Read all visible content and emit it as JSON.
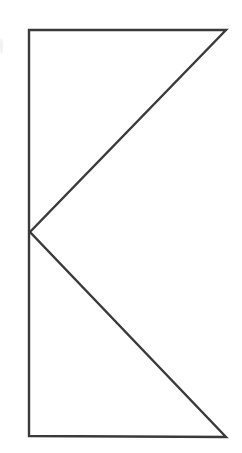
{
  "figure": {
    "title": "K-shaped geometric line figure",
    "canvas": {
      "width": 242,
      "height": 453,
      "background_color": "#ffffff"
    },
    "style": {
      "stroke_color": "#3a3a3a",
      "stroke_width": 2.4,
      "fill": "none"
    },
    "vertices": {
      "top_left": {
        "label": "top-left corner",
        "x": 29,
        "y": 30
      },
      "top_right": {
        "label": "top-right corner",
        "x": 226,
        "y": 30
      },
      "mid_left": {
        "label": "mid-left vertex",
        "x": 30,
        "y": 232
      },
      "bottom_right": {
        "label": "bottom-right corner",
        "x": 226,
        "y": 437
      },
      "bottom_left": {
        "label": "bottom-left corner",
        "x": 29,
        "y": 436
      }
    },
    "segments": [
      {
        "name": "top-horizontal-edge",
        "from": "top_left",
        "to": "top_right",
        "orientation": "horizontal"
      },
      {
        "name": "upper-diagonal-edge",
        "from": "top_right",
        "to": "mid_left",
        "orientation": "diagonal"
      },
      {
        "name": "lower-diagonal-edge",
        "from": "mid_left",
        "to": "bottom_right",
        "orientation": "diagonal"
      },
      {
        "name": "bottom-horizontal-edge",
        "from": "bottom_right",
        "to": "bottom_left",
        "orientation": "horizontal"
      },
      {
        "name": "left-vertical-spine",
        "from": "bottom_left",
        "to": "top_left",
        "orientation": "vertical"
      }
    ],
    "path_d": "M 29 30 L 226 30 L 30 232 L 226 437 L 29 436 L 29 30 Z",
    "artifact": {
      "name": "left-edge-scan-artifact",
      "color": "#f2f2f2",
      "x": 0,
      "y": 38,
      "width": 3,
      "height": 16
    }
  }
}
